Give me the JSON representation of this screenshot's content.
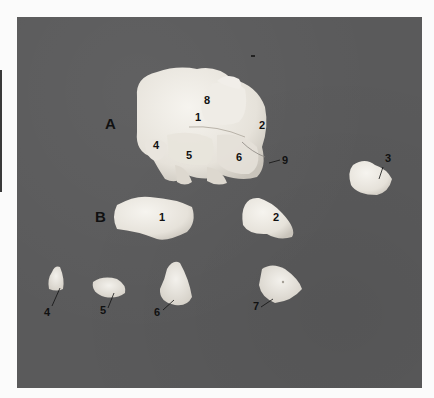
{
  "figure": {
    "background_color": "#5a5a5b",
    "bone_color": "#ece9e2",
    "panels": [
      {
        "id": "A",
        "label": "A",
        "description": "Articulated bone cluster",
        "numbers": [
          "8",
          "1",
          "2",
          "4",
          "5",
          "6",
          "9"
        ]
      },
      {
        "id": "B",
        "label": "B",
        "description": "Disarticulated bones",
        "numbers": [
          "1",
          "2",
          "4",
          "5",
          "6",
          "7"
        ]
      }
    ],
    "separate_bone_label": "3",
    "labels": {
      "A": "A",
      "B": "B",
      "a1": "1",
      "a2": "2",
      "a4": "4",
      "a5": "5",
      "a6": "6",
      "a8": "8",
      "a9": "9",
      "s3": "3",
      "b1": "1",
      "b2": "2",
      "b4": "4",
      "b5": "5",
      "b6": "6",
      "b7": "7"
    }
  }
}
